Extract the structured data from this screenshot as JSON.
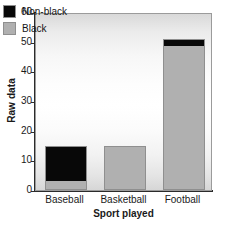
{
  "chart_data": {
    "type": "bar",
    "title": "",
    "xlabel": "Sport played",
    "ylabel": "Raw data",
    "categories": [
      "Baseball",
      "Basketball",
      "Football"
    ],
    "stacked": true,
    "series": [
      {
        "name": "Black",
        "color": "#b0b0b0",
        "values": [
          3,
          15,
          49
        ]
      },
      {
        "name": "Non-black",
        "color": "#080808",
        "values": [
          12,
          0,
          2
        ]
      }
    ],
    "totals": [
      15,
      15,
      51
    ],
    "ylim": [
      0,
      60
    ],
    "yticks": [
      0,
      10,
      20,
      30,
      40,
      50,
      60
    ],
    "ytick_labels": [
      "0",
      "10",
      "20",
      "30",
      "40",
      "50",
      "60"
    ],
    "grid": false,
    "legend_position": "top-left",
    "legend_entries": [
      {
        "label": "Non-black",
        "color": "#080808"
      },
      {
        "label": "Black",
        "color": "#b0b0b0"
      }
    ]
  },
  "axes": {
    "y_title": "Raw data",
    "x_title": "Sport played"
  }
}
